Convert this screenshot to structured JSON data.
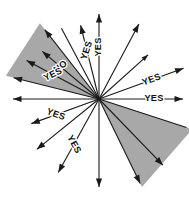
{
  "figure": {
    "type": "vector-ray-diagram",
    "center": {
      "x": 99,
      "y": 99
    },
    "background_color": "#ffffff",
    "shade_color": "#a8a8a8",
    "ray_color": "#1a1a1a",
    "label_color": "#111111"
  },
  "shaded_wedges": [
    {
      "name": "upper-left-wedge",
      "start_angle_deg": 128,
      "end_angle_deg": 166,
      "radius": 96,
      "fill": "#a8a8a8"
    },
    {
      "name": "lower-right-wedge",
      "start_angle_deg": -64,
      "end_angle_deg": -18,
      "radius": 98,
      "fill": "#a8a8a8"
    }
  ],
  "rays": [
    {
      "id": "ray-e",
      "angle_deg": 0,
      "length": 84,
      "label": "YES",
      "label_distance": 55,
      "label_rotation": 0,
      "head": "large"
    },
    {
      "id": "ray-ene",
      "angle_deg": 20,
      "length": 90,
      "label": "YES",
      "label_distance": 56,
      "label_rotation": -20,
      "head": "large"
    },
    {
      "id": "ray-ne",
      "angle_deg": 42,
      "length": 66,
      "label": "",
      "label_distance": 0,
      "label_rotation": 0,
      "head": "small"
    },
    {
      "id": "ray-nne",
      "angle_deg": 62,
      "length": 85,
      "label": "",
      "label_distance": 0,
      "label_rotation": 0,
      "head": "large"
    },
    {
      "id": "ray-n",
      "angle_deg": 90,
      "length": 85,
      "label": "YES",
      "label_distance": 52,
      "label_rotation": -90,
      "head": "large"
    },
    {
      "id": "ray-nnw1",
      "angle_deg": 104,
      "length": 76,
      "label": "YES",
      "label_distance": 50,
      "label_rotation": -72,
      "head": "large"
    },
    {
      "id": "ray-nnw2",
      "angle_deg": 118,
      "length": 80,
      "label": "",
      "label_distance": 0,
      "label_rotation": 0,
      "head": "none"
    },
    {
      "id": "ray-nw1",
      "angle_deg": 128,
      "length": 88,
      "label": "",
      "label_distance": 0,
      "label_rotation": 0,
      "head": "large"
    },
    {
      "id": "ray-nw2",
      "angle_deg": 140,
      "length": 74,
      "label": "NO",
      "label_distance": 50,
      "label_rotation": -38,
      "head": "large"
    },
    {
      "id": "ray-wnw",
      "angle_deg": 152,
      "length": 82,
      "label": "YES",
      "label_distance": 52,
      "label_rotation": -26,
      "head": "large"
    },
    {
      "id": "ray-wnw2",
      "angle_deg": 166,
      "length": 88,
      "label": "",
      "label_distance": 0,
      "label_rotation": 0,
      "head": "large"
    },
    {
      "id": "ray-w",
      "angle_deg": 180,
      "length": 86,
      "label": "",
      "label_distance": 0,
      "label_rotation": 0,
      "head": "large"
    },
    {
      "id": "ray-wsw",
      "angle_deg": -160,
      "length": 72,
      "label": "YES",
      "label_distance": 46,
      "label_rotation": 20,
      "head": "large"
    },
    {
      "id": "ray-sw1",
      "angle_deg": -141,
      "length": 80,
      "label": "",
      "label_distance": 0,
      "label_rotation": 0,
      "head": "large"
    },
    {
      "id": "ray-sw2",
      "angle_deg": -119,
      "length": 84,
      "label": "YES",
      "label_distance": 52,
      "label_rotation": 61,
      "head": "large"
    },
    {
      "id": "ray-s",
      "angle_deg": -90,
      "length": 88,
      "label": "",
      "label_distance": 0,
      "label_rotation": 0,
      "head": "large"
    },
    {
      "id": "ray-sse",
      "angle_deg": -64,
      "length": 94,
      "label": "",
      "label_distance": 0,
      "label_rotation": 0,
      "head": "large"
    },
    {
      "id": "ray-se",
      "angle_deg": -46,
      "length": 92,
      "label": "",
      "label_distance": 0,
      "label_rotation": 0,
      "head": "large"
    },
    {
      "id": "ray-ese",
      "angle_deg": -18,
      "length": 92,
      "label": "",
      "label_distance": 0,
      "label_rotation": 0,
      "head": "none"
    }
  ]
}
